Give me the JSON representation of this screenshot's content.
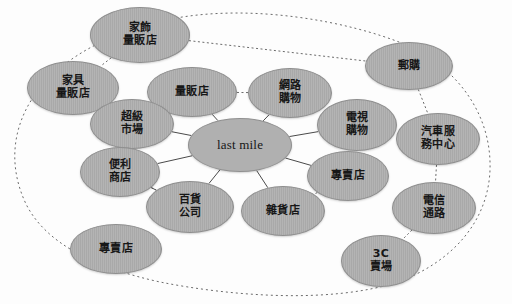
{
  "diagram": {
    "colors": {
      "node_fill": "#a9a9a9",
      "node_stroke": "#8f8f8f",
      "center_fill": "#b0b0b0",
      "solid_link": "#4a4a4a",
      "dashed_link": "#6b6b6b",
      "background": "#fdfdfd",
      "text": "#171717"
    },
    "center": {
      "id": "last-mile",
      "label": "last mile",
      "lines": [
        "last mile"
      ],
      "script": "latin",
      "cx": 240,
      "cy": 145,
      "rx": 52,
      "ry": 27
    },
    "nodes": [
      {
        "id": "home-decor-superstore",
        "label": "家飾量販店",
        "lines": [
          "家飾",
          "量販店"
        ],
        "script": "cjk",
        "ring": "outer",
        "cx": 140,
        "cy": 35,
        "rx": 50,
        "ry": 28
      },
      {
        "id": "furniture-superstore",
        "label": "家具量販店",
        "lines": [
          "家具",
          "量販店"
        ],
        "script": "cjk",
        "ring": "outer",
        "cx": 73,
        "cy": 88,
        "rx": 46,
        "ry": 27
      },
      {
        "id": "mail-order",
        "label": "郵購",
        "lines": [
          "郵購"
        ],
        "script": "cjk",
        "ring": "outer",
        "cx": 409,
        "cy": 66,
        "rx": 44,
        "ry": 24
      },
      {
        "id": "auto-service-center",
        "label": "汽車服務中心",
        "lines": [
          "汽車服",
          "務中心"
        ],
        "script": "cjk",
        "ring": "outer",
        "cx": 438,
        "cy": 139,
        "rx": 42,
        "ry": 26
      },
      {
        "id": "telecom-channel",
        "label": "電信通路",
        "lines": [
          "電信",
          "通路"
        ],
        "script": "cjk",
        "ring": "outer",
        "cx": 434,
        "cy": 208,
        "rx": 42,
        "ry": 26
      },
      {
        "id": "3c-store",
        "label": "3C賣場",
        "lines": [
          "3C",
          "賣場"
        ],
        "script": "cjk",
        "ring": "outer",
        "cx": 381,
        "cy": 261,
        "rx": 40,
        "ry": 26
      },
      {
        "id": "specialty-store-outer",
        "label": "專賣店",
        "lines": [
          "專賣店"
        ],
        "script": "cjk",
        "ring": "outer",
        "cx": 116,
        "cy": 249,
        "rx": 46,
        "ry": 25
      },
      {
        "id": "hypermarket",
        "label": "量販店",
        "lines": [
          "量販店"
        ],
        "script": "cjk",
        "ring": "inner",
        "cx": 192,
        "cy": 92,
        "rx": 45,
        "ry": 25
      },
      {
        "id": "online-shopping",
        "label": "網路購物",
        "lines": [
          "網路",
          "購物"
        ],
        "script": "cjk",
        "ring": "inner",
        "cx": 290,
        "cy": 93,
        "rx": 42,
        "ry": 25
      },
      {
        "id": "tv-shopping",
        "label": "電視購物",
        "lines": [
          "電視",
          "購物"
        ],
        "script": "cjk",
        "ring": "inner",
        "cx": 357,
        "cy": 125,
        "rx": 40,
        "ry": 26
      },
      {
        "id": "supermarket",
        "label": "超級市場",
        "lines": [
          "超級",
          "市場"
        ],
        "script": "cjk",
        "ring": "inner",
        "cx": 132,
        "cy": 124,
        "rx": 42,
        "ry": 25
      },
      {
        "id": "convenience-store",
        "label": "便利商店",
        "lines": [
          "便利",
          "商店"
        ],
        "script": "cjk",
        "ring": "inner",
        "cx": 120,
        "cy": 172,
        "rx": 40,
        "ry": 25
      },
      {
        "id": "department-store",
        "label": "百貨公司",
        "lines": [
          "百貨",
          "公司"
        ],
        "script": "cjk",
        "ring": "inner",
        "cx": 190,
        "cy": 207,
        "rx": 44,
        "ry": 26
      },
      {
        "id": "grocery-store",
        "label": "雜貨店",
        "lines": [
          "雜貨店"
        ],
        "script": "cjk",
        "ring": "inner",
        "cx": 283,
        "cy": 211,
        "rx": 42,
        "ry": 25
      },
      {
        "id": "specialty-store-inner",
        "label": "專賣店",
        "lines": [
          "專賣店"
        ],
        "script": "cjk",
        "ring": "inner",
        "cx": 348,
        "cy": 176,
        "rx": 41,
        "ry": 25
      }
    ],
    "solid_links": [
      {
        "from": "last-mile",
        "to": "hypermarket"
      },
      {
        "from": "last-mile",
        "to": "online-shopping"
      },
      {
        "from": "last-mile",
        "to": "tv-shopping"
      },
      {
        "from": "last-mile",
        "to": "supermarket"
      },
      {
        "from": "last-mile",
        "to": "convenience-store"
      },
      {
        "from": "last-mile",
        "to": "department-store"
      },
      {
        "from": "last-mile",
        "to": "grocery-store"
      },
      {
        "from": "last-mile",
        "to": "specialty-store-inner"
      },
      {
        "from": "convenience-store",
        "to": "department-store"
      },
      {
        "from": "supermarket",
        "to": "hypermarket"
      }
    ],
    "dashed_links": [
      {
        "from": "home-decor-superstore",
        "to": "furniture-superstore"
      },
      {
        "from": "home-decor-superstore",
        "to": "mail-order"
      },
      {
        "from": "hypermarket",
        "to": "online-shopping"
      },
      {
        "from": "mail-order",
        "to": "auto-service-center"
      },
      {
        "from": "auto-service-center",
        "to": "telecom-channel"
      },
      {
        "from": "telecom-channel",
        "to": "3c-store"
      },
      {
        "from": "specialty-store-inner",
        "to": "grocery-store"
      },
      {
        "from": "convenience-store",
        "to": "department-store"
      }
    ],
    "outer_ring": {
      "description": "dashed enclosing loop passing through the outer channel nodes",
      "stroke": "#6b6b6b",
      "dash": "2,3"
    }
  }
}
